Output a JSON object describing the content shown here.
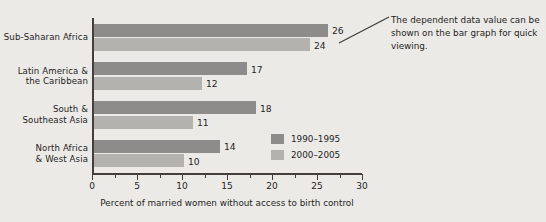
{
  "chart_data": {
    "type": "bar",
    "orientation": "horizontal",
    "title": "",
    "xlabel": "Percent of married women without access to birth control",
    "ylabel": "",
    "xlim": [
      0,
      30
    ],
    "xticks": [
      0,
      5,
      10,
      15,
      20,
      25,
      30
    ],
    "xtick_labels": [
      "0",
      "5",
      "10",
      "15",
      "20",
      "25",
      "30"
    ],
    "minor_tick_step": 2.5,
    "grid": false,
    "legend_position": "inside-lower-right",
    "categories": [
      "Sub-Saharan Africa",
      "Latin America & the Caribbean",
      "South & Southeast Asia",
      "North Africa & West Asia"
    ],
    "category_lines": [
      [
        "Sub-Saharan Africa"
      ],
      [
        "Latin America &",
        "the Caribbean"
      ],
      [
        "South &",
        "Southeast Asia"
      ],
      [
        "North Africa",
        "& West Asia"
      ]
    ],
    "series": [
      {
        "name": "1990–1995",
        "color": "#8d8c8a",
        "values": [
          26,
          17,
          18,
          14
        ],
        "value_labels": [
          "26",
          "17",
          "18",
          "14"
        ]
      },
      {
        "name": "2000–2005",
        "color": "#b4b2af",
        "values": [
          24,
          12,
          11,
          10
        ],
        "value_labels": [
          "24",
          "12",
          "11",
          "10"
        ]
      }
    ]
  },
  "annotation": {
    "text": "The dependent data value can be shown on the bar graph for quick viewing.",
    "leader_line": true
  },
  "colors": {
    "background": "#eceae7",
    "axis": "#423f3d",
    "text": "#231f1d",
    "series_1990_1995": "#8d8c8a",
    "series_2000_2005": "#b4b2af"
  }
}
